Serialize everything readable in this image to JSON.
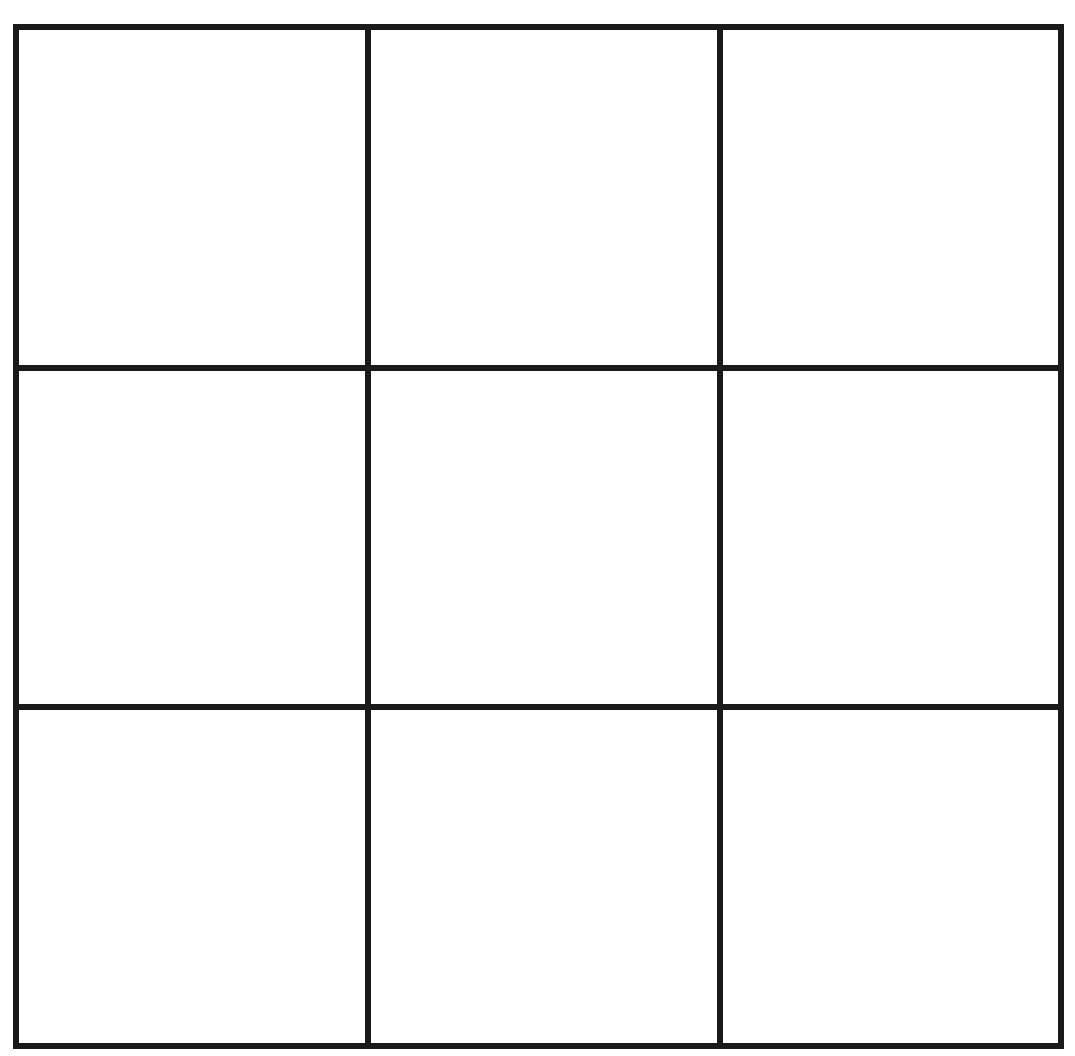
{
  "game": {
    "type": "tic-tac-toe",
    "grid_size": 3,
    "line_color": "#1a1a1a",
    "background_color": "#ffffff",
    "cells": [
      {
        "row": 0,
        "col": 0,
        "value": ""
      },
      {
        "row": 0,
        "col": 1,
        "value": ""
      },
      {
        "row": 0,
        "col": 2,
        "value": ""
      },
      {
        "row": 1,
        "col": 0,
        "value": ""
      },
      {
        "row": 1,
        "col": 1,
        "value": ""
      },
      {
        "row": 1,
        "col": 2,
        "value": ""
      },
      {
        "row": 2,
        "col": 0,
        "value": ""
      },
      {
        "row": 2,
        "col": 1,
        "value": ""
      },
      {
        "row": 2,
        "col": 2,
        "value": ""
      }
    ]
  }
}
